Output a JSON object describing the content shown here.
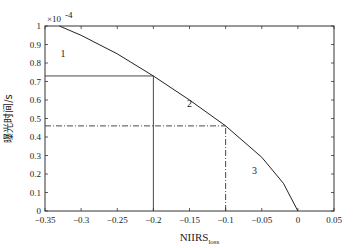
{
  "chart_data": {
    "type": "line",
    "title": "",
    "xlabel": "NIIRS",
    "xlabel_subscript": "loss",
    "ylabel": "曝光时间/s",
    "y_multiplier": "×10",
    "y_multiplier_exp": "-4",
    "xlim": [
      -0.35,
      0.05
    ],
    "ylim": [
      0,
      1
    ],
    "grid": false,
    "x_ticks": [
      "-0.35",
      "-0.3",
      "-0.25",
      "-0.2",
      "-0.15",
      "-0.1",
      "-0.05",
      "0",
      "0.05"
    ],
    "y_ticks": [
      "0",
      "0.1",
      "0.2",
      "0.3",
      "0.4",
      "0.5",
      "0.6",
      "0.7",
      "0.8",
      "0.9",
      "1"
    ],
    "series": [
      {
        "name": "curve",
        "x": [
          -0.33,
          -0.3,
          -0.25,
          -0.2,
          -0.15,
          -0.1,
          -0.05,
          -0.02,
          0
        ],
        "y": [
          1.0,
          0.95,
          0.85,
          0.73,
          0.6,
          0.46,
          0.29,
          0.15,
          0.0
        ]
      }
    ],
    "reference_lines": [
      {
        "style": "solid",
        "type": "horizontal",
        "y": 0.73,
        "x_from": -0.35,
        "x_to": -0.2
      },
      {
        "style": "solid",
        "type": "vertical",
        "x": -0.2,
        "y_from": 0,
        "y_to": 0.73
      },
      {
        "style": "dash-dot",
        "type": "horizontal",
        "y": 0.46,
        "x_from": -0.35,
        "x_to": -0.1
      },
      {
        "style": "dash-dot",
        "type": "vertical",
        "x": -0.1,
        "y_from": 0,
        "y_to": 0.46
      }
    ],
    "annotations": [
      {
        "text": "1",
        "x": -0.325,
        "y": 0.83
      },
      {
        "text": "2",
        "x": -0.15,
        "y": 0.56
      },
      {
        "text": "3",
        "x": -0.06,
        "y": 0.2
      }
    ]
  }
}
